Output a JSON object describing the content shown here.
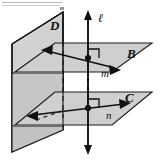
{
  "figure": {
    "background_color": "#ffffff",
    "plane_fill_light": "#d9d9d9",
    "plane_fill_mid": "#cccccc",
    "plane_fill_dark": "#bdbdbd",
    "stroke_color": "#1a1a1a",
    "labels": {
      "vertical_line": "ℓ",
      "vertical_plane": "D",
      "upper_plane": "B",
      "lower_plane": "C",
      "upper_line": "m",
      "lower_line": "n"
    },
    "elements": {
      "vertical_line_name": "line-ell",
      "upper_plane_name": "plane-B",
      "lower_plane_name": "plane-C",
      "vertical_plane_name": "plane-D",
      "upper_intersection_point": "point-upper",
      "lower_intersection_point": "point-lower",
      "upper_right_angle": "right-angle-upper",
      "lower_right_angle": "right-angle-lower"
    },
    "top_artifact": {
      "visible": true,
      "color": "#b5b5b5"
    }
  }
}
